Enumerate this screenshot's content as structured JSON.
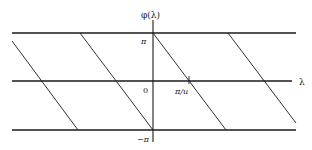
{
  "figure": {
    "y_axis_label": "φ(λ)",
    "x_axis_label": "λ",
    "ticks": {
      "pi": "π",
      "zero": "0",
      "neg_pi": "−π",
      "pi_over_u": "π/u"
    },
    "horizontal_lines": [
      "φ = π",
      "φ = 0 (λ axis)",
      "φ = −π"
    ],
    "diagonal_segment_count": 4
  }
}
